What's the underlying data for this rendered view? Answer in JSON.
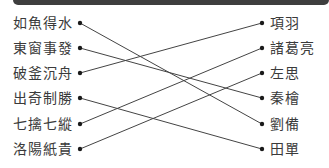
{
  "header": {
    "bar_color": "#3e3e3e"
  },
  "left_items": [
    {
      "label": "如魚得水"
    },
    {
      "label": "東窗事發"
    },
    {
      "label": "破釜沉舟"
    },
    {
      "label": "出奇制勝"
    },
    {
      "label": "七擒七縱"
    },
    {
      "label": "洛陽紙貴"
    }
  ],
  "right_items": [
    {
      "label": "項羽"
    },
    {
      "label": "諸葛亮"
    },
    {
      "label": "左思"
    },
    {
      "label": "秦檜"
    },
    {
      "label": "劉備"
    },
    {
      "label": "田單"
    }
  ],
  "connections": [
    {
      "from": "如魚得水",
      "to": "劉備"
    },
    {
      "from": "東窗事發",
      "to": "秦檜"
    },
    {
      "from": "破釜沉舟",
      "to": "項羽"
    },
    {
      "from": "出奇制勝",
      "to": "田單"
    },
    {
      "from": "七擒七縱",
      "to": "諸葛亮"
    },
    {
      "from": "洛陽紙貴",
      "to": "左思"
    }
  ],
  "line_color": "#444444"
}
